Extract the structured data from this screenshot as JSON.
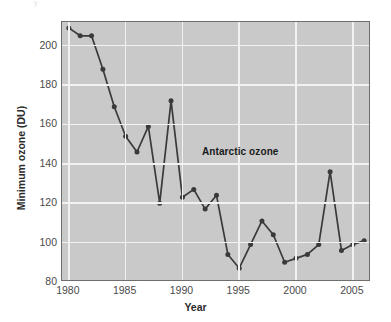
{
  "figure": {
    "faint_caption": "y"
  },
  "chart_data": {
    "type": "line",
    "title": "",
    "annotation": "Antarctic ozone",
    "xlabel": "Year",
    "ylabel": "Minimum ozone (DU)",
    "xlim": [
      1979.4,
      2006.6
    ],
    "ylim": [
      80,
      212
    ],
    "grid": true,
    "legend": "none",
    "marker": "circle",
    "line_color": "#3a3a3a",
    "marker_color": "#3a3a3a",
    "plot_bg_color": "#c9c9c9",
    "grid_color": "#f2f2f2",
    "frame_color": "#6e6e6e",
    "xticks": [
      1980,
      1985,
      1990,
      1995,
      2000,
      2005
    ],
    "xtick_labels": [
      "1980",
      "1985",
      "1990",
      "1995",
      "2000",
      "2005"
    ],
    "yticks": [
      80,
      100,
      120,
      140,
      160,
      180,
      200
    ],
    "ytick_labels": [
      "80",
      "100",
      "120",
      "140",
      "160",
      "180",
      "200"
    ],
    "x": [
      1980,
      1981,
      1982,
      1983,
      1984,
      1985,
      1986,
      1987,
      1988,
      1989,
      1990,
      1991,
      1992,
      1993,
      1994,
      1995,
      1996,
      1997,
      1998,
      1999,
      2000,
      2001,
      2002,
      2003,
      2004,
      2005,
      2006
    ],
    "values": [
      209,
      205,
      205,
      188,
      169,
      154,
      146,
      159,
      120,
      172,
      123,
      127,
      117,
      124,
      94,
      87,
      99,
      111,
      104,
      90,
      92,
      94,
      99,
      136,
      96,
      99,
      101
    ],
    "series": [
      {
        "name": "Antarctic minimum ozone",
        "values": [
          209,
          205,
          205,
          188,
          169,
          154,
          146,
          159,
          120,
          172,
          123,
          127,
          117,
          124,
          94,
          87,
          99,
          111,
          104,
          90,
          92,
          94,
          99,
          136,
          96,
          99,
          101
        ]
      }
    ]
  }
}
